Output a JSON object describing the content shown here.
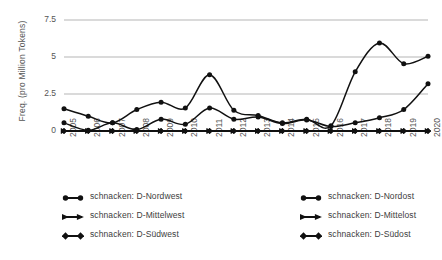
{
  "chart_data": {
    "type": "line",
    "title": "",
    "xlabel": "",
    "ylabel": "Freq. (pro Million Tokens)",
    "x": [
      2005,
      2006,
      2007,
      2008,
      2009,
      2010,
      2011,
      2012,
      2013,
      2014,
      2015,
      2016,
      2017,
      2018,
      2019,
      2020
    ],
    "xtick_labels": [
      "2005",
      "2006",
      "2007",
      "2008",
      "2009",
      "2010",
      "2011",
      "2012",
      "2013",
      "2014",
      "2015",
      "2016",
      "2017",
      "2018",
      "2019",
      "2020"
    ],
    "ytick_labels": [
      "0",
      "2.5",
      "5",
      "7.5"
    ],
    "ytick_values": [
      0,
      2.5,
      5,
      7.5
    ],
    "ylim": [
      0,
      7.5
    ],
    "grid": "horizontal",
    "legend_position": "below-two-columns",
    "series": [
      {
        "name": "schnacken: D-Nordwest",
        "marker": "circle",
        "color": "#111111",
        "values": [
          1.5,
          1.0,
          0.55,
          1.45,
          1.95,
          1.55,
          3.8,
          1.4,
          1.05,
          0.55,
          0.8,
          0.35,
          4.0,
          5.95,
          4.55,
          5.05
        ]
      },
      {
        "name": "schnacken: D-Nordost",
        "marker": "circle",
        "color": "#111111",
        "values": [
          0.55,
          0.05,
          0.55,
          0.1,
          0.8,
          0.45,
          1.55,
          0.8,
          0.95,
          0.5,
          0.75,
          0.3,
          0.55,
          0.9,
          1.45,
          3.2
        ]
      },
      {
        "name": "schnacken: D-Mittelwest",
        "marker": "triangle",
        "color": "#111111",
        "values": [
          0,
          0,
          0,
          0,
          0,
          0,
          0,
          0,
          0,
          0,
          0,
          0,
          0,
          0,
          0,
          0
        ]
      },
      {
        "name": "schnacken: D-Mittelost",
        "marker": "triangle",
        "color": "#111111",
        "values": [
          0,
          0,
          0,
          0,
          0,
          0,
          0,
          0,
          0,
          0,
          0,
          0,
          0,
          0,
          0,
          0
        ]
      },
      {
        "name": "schnacken: D-Südwest",
        "marker": "diamond",
        "color": "#111111",
        "values": [
          0,
          0,
          0,
          0,
          0,
          0,
          0,
          0,
          0,
          0,
          0,
          0,
          0,
          0,
          0,
          0
        ]
      },
      {
        "name": "schnacken: D-Südost",
        "marker": "diamond",
        "color": "#111111",
        "values": [
          0,
          0,
          0,
          0,
          0,
          0,
          0,
          0,
          0,
          0,
          0,
          0,
          0,
          0,
          0,
          0
        ]
      }
    ]
  },
  "axis": {
    "ylabel": "Freq. (pro Million Tokens)",
    "yticks": [
      "7.5",
      "5",
      "2.5",
      "0"
    ],
    "xticks": [
      "2005",
      "2006",
      "2007",
      "2008",
      "2009",
      "2010",
      "2011",
      "2012",
      "2013",
      "2014",
      "2015",
      "2016",
      "2017",
      "2018",
      "2019",
      "2020"
    ]
  },
  "legend": {
    "left_column": [
      {
        "label": "schnacken: D-Nordwest",
        "marker": "circle"
      },
      {
        "label": "schnacken: D-Mittelwest",
        "marker": "triangle"
      },
      {
        "label": "schnacken: D-Südwest",
        "marker": "diamond"
      }
    ],
    "right_column": [
      {
        "label": "schnacken: D-Nordost",
        "marker": "circle"
      },
      {
        "label": "schnacken: D-Mittelost",
        "marker": "triangle"
      },
      {
        "label": "schnacken: D-Südost",
        "marker": "diamond"
      }
    ]
  },
  "colors": {
    "line": "#111111",
    "grid": "#b5b5b5",
    "text": "#555555",
    "background": "#ffffff"
  }
}
